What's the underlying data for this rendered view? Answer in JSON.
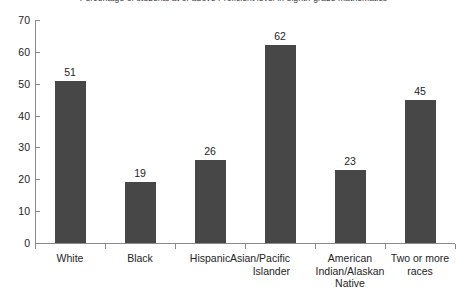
{
  "chart_data": {
    "type": "bar",
    "title": "Percentage of students at or above Proficient level in eighth-grade mathematics",
    "subtitle": "",
    "xlabel": "",
    "ylabel": "",
    "categories": [
      "White",
      "Black",
      "Hispanic",
      "Asian/Pacific Islander",
      "American Indian/Alaskan Native",
      "Two or more races"
    ],
    "category_lines": [
      [
        "White"
      ],
      [
        "Black"
      ],
      [
        "Hispanic"
      ],
      [
        "Asian/Pacific",
        "Islander"
      ],
      [
        "American",
        "Indian/Alaskan",
        "Native"
      ],
      [
        "Two or more",
        "races"
      ]
    ],
    "values": [
      51,
      19,
      26,
      62,
      23,
      45
    ],
    "value_labels": [
      "51",
      "19",
      "26",
      "62",
      "23",
      "45"
    ],
    "ylim": [
      0,
      70
    ],
    "yticks": [
      0,
      10,
      20,
      30,
      40,
      50,
      60,
      70
    ],
    "ytick_labels": [
      "0",
      "10",
      "20",
      "30",
      "40",
      "50",
      "60",
      "70"
    ],
    "grid": false,
    "legend": null,
    "bar_color": "#474747",
    "axis_color": "#8a8a8a",
    "text_color": "#242424",
    "background": "#ffffff"
  }
}
